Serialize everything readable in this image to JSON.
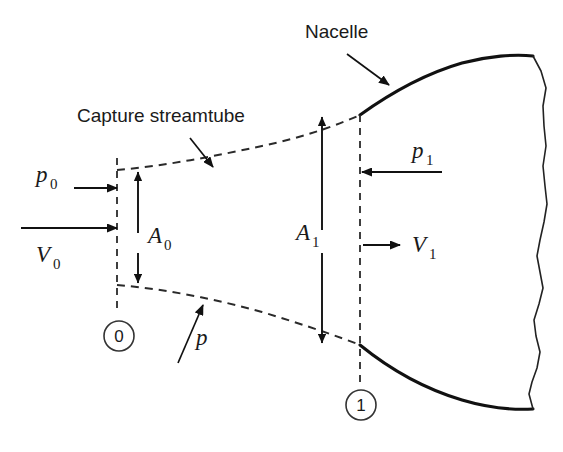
{
  "figure": {
    "background_color": "#ffffff",
    "line_color": "#111111",
    "dashed_color": "#2a2a2a"
  },
  "annotations": {
    "nacelle": {
      "label": "Nacelle",
      "x": 305,
      "y": 38
    },
    "capture_streamtube": {
      "label": "Capture streamtube",
      "x": 77,
      "y": 122
    },
    "static_pressure": {
      "symbol": "p",
      "subscript": "",
      "x": 196,
      "y": 345
    }
  },
  "stations": [
    {
      "name": "station-0",
      "label": "0",
      "cx": 119,
      "cy": 336,
      "r": 15
    },
    {
      "name": "station-1",
      "label": "1",
      "cx": 361,
      "cy": 405,
      "r": 15
    }
  ],
  "flow_variables": [
    {
      "name": "upstream-pressure",
      "symbol": "p",
      "subscript": "0",
      "label_x": 36,
      "label_y": 182,
      "arrow_dir": "right"
    },
    {
      "name": "upstream-velocity",
      "symbol": "V",
      "subscript": "0",
      "label_x": 36,
      "label_y": 262,
      "arrow_dir": "right"
    },
    {
      "name": "capture-area-0",
      "symbol": "A",
      "subscript": "0",
      "label_x": 132,
      "label_y": 243,
      "arrow_dir": "double-vertical"
    },
    {
      "name": "inlet-area-1",
      "symbol": "A",
      "subscript": "1",
      "label_x": 298,
      "label_y": 240,
      "arrow_dir": "double-vertical"
    },
    {
      "name": "inlet-pressure",
      "symbol": "p",
      "subscript": "1",
      "label_x": 412,
      "label_y": 158,
      "arrow_dir": "left"
    },
    {
      "name": "inlet-velocity",
      "symbol": "V",
      "subscript": "1",
      "label_x": 412,
      "label_y": 252,
      "arrow_dir": "right"
    }
  ],
  "geometry": {
    "station0_x": 117,
    "station1_x": 360,
    "streamtube_upper_start_y": 170,
    "streamtube_lower_start_y": 285,
    "nacelle_lip_upper_y": 115,
    "nacelle_lip_lower_y": 345
  }
}
